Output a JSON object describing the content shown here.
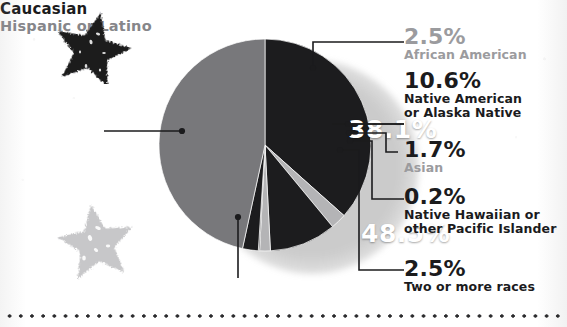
{
  "chart_data": {
    "type": "pie",
    "title": "",
    "legend_position": "callout-labels",
    "categories": [
      "Caucasian",
      "African American",
      "Native American or Alaska Native",
      "Asian",
      "Native Hawaiian or other Pacific Islander",
      "Two or more races",
      "Hispanic or Latino"
    ],
    "values": [
      38.1,
      2.5,
      10.6,
      1.7,
      0.2,
      2.5,
      48.5
    ],
    "value_labels": [
      "38.1%",
      "2.5%",
      "10.6%",
      "1.7%",
      "0.2%",
      "2.5%",
      "48.5%"
    ],
    "colors": [
      "#1c1c1e",
      "#b4b4b6",
      "#1c1c1e",
      "#b4b4b6",
      "#1c1c1e",
      "#1c1c1e",
      "#78787b"
    ],
    "slice_label_colors": [
      "#1b1b1d",
      "#9b9b9e",
      "#1b1b1d",
      "#9b9b9e",
      "#1b1b1d",
      "#1b1b1d",
      "#86868a"
    ],
    "inside_labels": [
      {
        "category": "Caucasian",
        "text": "38.1%"
      },
      {
        "category": "Hispanic or Latino",
        "text": "48.5%"
      }
    ],
    "units": "percent",
    "total": 104.1
  },
  "pie": {
    "caucasian_pct": "38.1%",
    "hispanic_pct": "48.5%"
  },
  "callouts": {
    "african_american": {
      "value": "2.5%",
      "name": "African American"
    },
    "native_american": {
      "value": "10.6%",
      "name_line1": "Native American",
      "name_line2": "or Alaska Native"
    },
    "asian": {
      "value": "1.7%",
      "name": "Asian"
    },
    "native_hawaiian": {
      "value": "0.2%",
      "name_line1": "Native Hawaiian or",
      "name_line2": "other Pacific Islander"
    },
    "two_or_more": {
      "value": "2.5%",
      "name": "Two or more races"
    },
    "caucasian": {
      "name": "Caucasian"
    },
    "hispanic": {
      "name": "Hispanic or Latino"
    }
  },
  "decor": {
    "star_top": "star-icon",
    "star_bottom": "star-icon",
    "divider": "dotted-divider"
  },
  "theme": {
    "ink": "#1b1b1d",
    "gray_mid": "#78787b",
    "gray_light": "#b4b4b6",
    "gray_text": "#9b9b9e",
    "background": "#ffffff"
  }
}
